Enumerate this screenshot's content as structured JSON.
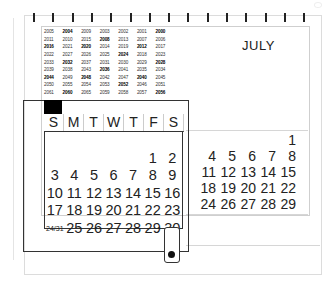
{
  "calendar": {
    "month": "JULY",
    "ring_count": 15,
    "year_grid": [
      [
        {
          "y": "2005"
        },
        {
          "y": "2004",
          "b": true
        },
        {
          "y": "2009"
        },
        {
          "y": "2003"
        },
        {
          "y": "2002"
        },
        {
          "y": "2001"
        },
        {
          "y": "2000",
          "b": true
        }
      ],
      [
        {
          "y": "2011"
        },
        {
          "y": "2010"
        },
        {
          "y": "2015"
        },
        {
          "y": "2008",
          "b": true
        },
        {
          "y": "2013"
        },
        {
          "y": "2007"
        },
        {
          "y": "2006"
        }
      ],
      [
        {
          "y": "2016",
          "b": true
        },
        {
          "y": "2021"
        },
        {
          "y": "2020",
          "b": true
        },
        {
          "y": "2014"
        },
        {
          "y": "2019"
        },
        {
          "y": "2012",
          "b": true
        },
        {
          "y": "2017"
        }
      ],
      [
        {
          "y": "2022"
        },
        {
          "y": "2027"
        },
        {
          "y": "2026"
        },
        {
          "y": "2025"
        },
        {
          "y": "2024",
          "b": true
        },
        {
          "y": "2018"
        },
        {
          "y": "2023"
        }
      ],
      [
        {
          "y": "2033"
        },
        {
          "y": "2032",
          "b": true
        },
        {
          "y": "2037"
        },
        {
          "y": "2031"
        },
        {
          "y": "2030"
        },
        {
          "y": "2029"
        },
        {
          "y": "2028",
          "b": true
        }
      ],
      [
        {
          "y": "2039"
        },
        {
          "y": "2038"
        },
        {
          "y": "2043"
        },
        {
          "y": "2036",
          "b": true
        },
        {
          "y": "2041"
        },
        {
          "y": "2035"
        },
        {
          "y": "2034"
        }
      ],
      [
        {
          "y": "2044",
          "b": true
        },
        {
          "y": "2049"
        },
        {
          "y": "2048",
          "b": true
        },
        {
          "y": "2042"
        },
        {
          "y": "2047"
        },
        {
          "y": "2040",
          "b": true
        },
        {
          "y": "2045"
        }
      ],
      [
        {
          "y": "2050"
        },
        {
          "y": "2055"
        },
        {
          "y": "2054"
        },
        {
          "y": "2053"
        },
        {
          "y": "2052",
          "b": true
        },
        {
          "y": "2046"
        },
        {
          "y": "2051"
        }
      ],
      [
        {
          "y": "2061"
        },
        {
          "y": "2060",
          "b": true
        },
        {
          "y": "2065"
        },
        {
          "y": "2059"
        },
        {
          "y": "2058"
        },
        {
          "y": "2057"
        },
        {
          "y": "2056",
          "b": true
        }
      ]
    ],
    "weekdays": [
      "S",
      "M",
      "T",
      "W",
      "T",
      "F",
      "S"
    ],
    "main_days": [
      [
        "",
        "",
        "",
        "",
        "",
        "",
        ""
      ],
      [
        "",
        "",
        "",
        "",
        "",
        "1",
        "2"
      ],
      [
        "3",
        "4",
        "5",
        "6",
        "7",
        "8",
        "9"
      ],
      [
        "10",
        "11",
        "12",
        "13",
        "14",
        "15",
        "16"
      ],
      [
        "17",
        "18",
        "19",
        "20",
        "21",
        "22",
        "23"
      ],
      [
        "24/31",
        "25",
        "26",
        "27",
        "28",
        "29",
        "30"
      ]
    ],
    "back_days": [
      [
        "",
        "",
        "",
        "",
        "1"
      ],
      [
        "4",
        "5",
        "6",
        "7",
        "8"
      ],
      [
        "11",
        "12",
        "13",
        "14",
        "15"
      ],
      [
        "18",
        "19",
        "20",
        "21",
        "22"
      ],
      [
        "24",
        "26",
        "27",
        "28",
        "29"
      ]
    ]
  }
}
